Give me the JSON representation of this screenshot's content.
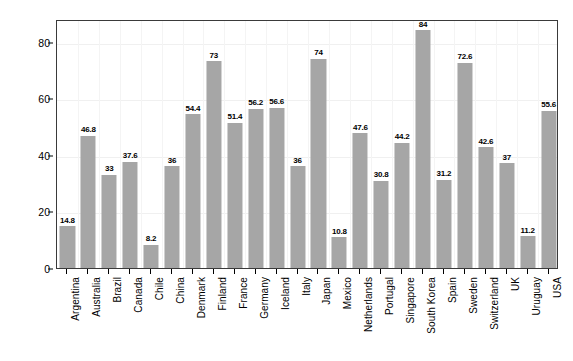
{
  "chart_data": {
    "type": "bar",
    "title": "",
    "xlabel": "",
    "ylabel": "Mean of score",
    "ylim": [
      0,
      88
    ],
    "grid": true,
    "legend": false,
    "y_ticks": [
      0,
      20,
      40,
      60,
      80
    ],
    "categories": [
      "Argentina",
      "Australia",
      "Brazil",
      "Canada",
      "Chile",
      "China",
      "Denmark",
      "Finland",
      "France",
      "Germany",
      "Iceland",
      "Italy",
      "Japan",
      "Mexico",
      "Netherlands",
      "Portugal",
      "Singapore",
      "South Korea",
      "Spain",
      "Sweden",
      "Switzerland",
      "UK",
      "Uruguay",
      "USA"
    ],
    "values": [
      14.8,
      46.8,
      33,
      37.6,
      8.2,
      36,
      54.4,
      73,
      51.4,
      56.2,
      56.6,
      36,
      74,
      10.8,
      47.6,
      30.8,
      44.2,
      84,
      31.2,
      72.6,
      42.6,
      37,
      11.2,
      55.6
    ],
    "value_labels": [
      "14.8",
      "46.8",
      "33",
      "37.6",
      "8.2",
      "36",
      "54.4",
      "73",
      "51.4",
      "56.2",
      "56.6",
      "36",
      "74",
      "10.8",
      "47.6",
      "30.8",
      "44.2",
      "84",
      "31.2",
      "72.6",
      "42.6",
      "37",
      "11.2",
      "55.6"
    ],
    "bar_color": "#a6a6a6",
    "frame_color": "#3a3a3a",
    "grid_color": "#f0f0f0",
    "text_color": "#000000"
  }
}
